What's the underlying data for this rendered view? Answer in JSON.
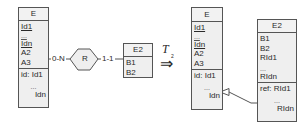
{
  "left": {
    "entity_e": {
      "name": "E",
      "attributes": [
        "Id1",
        "...",
        "Idn",
        "A2",
        "A3"
      ],
      "identifier": {
        "label": "id: Id1",
        "dots": "...",
        "last": "Idn"
      }
    },
    "relationship": {
      "name": "R",
      "card_e": "0-N",
      "card_e2": "1-1"
    },
    "entity_e2": {
      "name": "E2",
      "attributes": [
        "B1",
        "B2"
      ]
    }
  },
  "transform": {
    "symbol": "T",
    "subscript": "2",
    "arrow": "⇒"
  },
  "right": {
    "entity_e": {
      "name": "E",
      "attributes": [
        "Id1",
        "...",
        "Idn",
        "A2",
        "A3"
      ],
      "identifier": {
        "label": "id: Id1",
        "dots": "...",
        "last": "Idn"
      }
    },
    "entity_e2": {
      "name": "E2",
      "attributes": [
        "B1",
        "B2",
        "RId1",
        "...",
        "RIdn"
      ],
      "reference": {
        "label": "ref: RId1",
        "dots": "...",
        "last": "RIdn"
      }
    }
  },
  "colors": {
    "box_fill": "#efefef",
    "border": "#555555",
    "text": "#2a2a2a"
  }
}
